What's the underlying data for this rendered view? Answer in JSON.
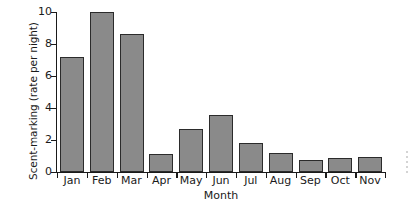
{
  "chart_data": {
    "type": "bar",
    "title": "",
    "subtitle": "",
    "xlabel": "Month",
    "ylabel": "Scent-marking (rate per night)",
    "categories": [
      "Jan",
      "Feb",
      "Mar",
      "Apr",
      "May",
      "Jun",
      "Jul",
      "Aug",
      "Sep",
      "Oct",
      "Nov"
    ],
    "values": [
      7.2,
      10.0,
      8.6,
      1.1,
      2.7,
      3.55,
      1.8,
      1.2,
      0.75,
      0.85,
      0.95
    ],
    "ylim": [
      0,
      10
    ],
    "yticks": [
      0,
      2,
      4,
      6,
      8,
      10
    ],
    "ytick_labels": [
      "0",
      "2",
      "4",
      "6",
      "8",
      "10"
    ],
    "grid": false,
    "legend": false,
    "legend_position": "none",
    "bar_fill_color": "#8a8a8a",
    "bar_edge_color": "#2b2b2b",
    "axis_color": "#1a1a1a",
    "background_color": "#ffffff",
    "annotations": []
  }
}
